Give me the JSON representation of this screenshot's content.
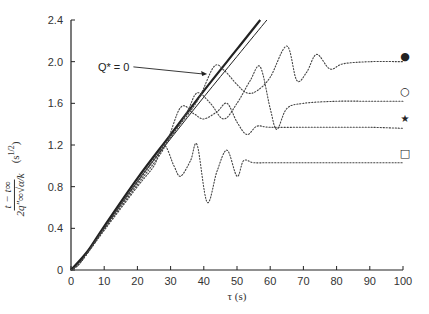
{
  "chart_data": {
    "type": "scatter",
    "title": "",
    "xlabel": "τ (s)",
    "ylabel": "(t − t∞) / (2q″∞ √α / k)",
    "ylabel_parts": {
      "numerator": "t − t∞",
      "denominator": "2q″∞√α/k",
      "units": "(s^1/2)"
    },
    "xlim": [
      0,
      100
    ],
    "ylim": [
      0,
      2.4
    ],
    "xticks": [
      0,
      10,
      20,
      30,
      40,
      50,
      60,
      70,
      80,
      90,
      100
    ],
    "yticks": [
      0,
      0.4,
      0.8,
      1.2,
      1.6,
      2.0,
      2.4
    ],
    "ytick_labels": [
      "0",
      "0.4",
      "0.8",
      "1.2",
      "1.6",
      "2.0",
      "2.4"
    ],
    "grid": false,
    "legend_position": "right-end markers",
    "annotations": [
      {
        "text": "Q* = 0",
        "x": 20,
        "y": 1.95,
        "arrow_to": [
          41,
          1.9
        ]
      }
    ],
    "series": [
      {
        "name": "Q* = 0 (theory, thick)",
        "style": "solid-thick",
        "x": [
          0,
          5,
          10,
          20,
          30,
          40,
          50,
          57
        ],
        "y": [
          0,
          0.18,
          0.42,
          0.88,
          1.3,
          1.72,
          2.12,
          2.4
        ]
      },
      {
        "name": "theory (thin)",
        "style": "solid-thin",
        "x": [
          0,
          5,
          10,
          20,
          30,
          40,
          50,
          59
        ],
        "y": [
          0,
          0.17,
          0.4,
          0.85,
          1.26,
          1.66,
          2.05,
          2.4
        ]
      },
      {
        "name": "filled circle",
        "marker": "●",
        "style": "dotted",
        "x": [
          0,
          3,
          10,
          20,
          30,
          38,
          43,
          46,
          50,
          53,
          56,
          60,
          65,
          68,
          71,
          74,
          78,
          82,
          90,
          100
        ],
        "y": [
          0,
          0.08,
          0.4,
          0.85,
          1.28,
          1.62,
          1.95,
          1.92,
          1.78,
          1.7,
          1.72,
          1.85,
          2.15,
          1.82,
          1.9,
          2.07,
          1.93,
          1.98,
          2.0,
          2.0
        ]
      },
      {
        "name": "open circle",
        "marker": "○",
        "style": "dotted",
        "x": [
          0,
          3,
          10,
          20,
          30,
          35,
          38,
          42,
          46,
          50,
          54,
          57,
          60,
          62,
          65,
          70,
          80,
          90,
          100
        ],
        "y": [
          0,
          0.08,
          0.4,
          0.84,
          1.27,
          1.52,
          1.7,
          1.6,
          1.45,
          1.6,
          1.82,
          1.95,
          1.55,
          1.35,
          1.55,
          1.6,
          1.62,
          1.62,
          1.62
        ]
      },
      {
        "name": "star",
        "marker": "★",
        "style": "dotted",
        "x": [
          0,
          3,
          10,
          20,
          28,
          33,
          37,
          40,
          44,
          47,
          50,
          53,
          56,
          60,
          70,
          80,
          90,
          100
        ],
        "y": [
          0,
          0.08,
          0.39,
          0.82,
          1.17,
          1.56,
          1.5,
          1.45,
          1.52,
          1.6,
          1.42,
          1.3,
          1.38,
          1.37,
          1.37,
          1.37,
          1.37,
          1.36
        ]
      },
      {
        "name": "open square",
        "marker": "□",
        "style": "dotted",
        "x": [
          0,
          3,
          10,
          20,
          25,
          28,
          31,
          33,
          36,
          38,
          41,
          44,
          47,
          50,
          52,
          55,
          60,
          70,
          80,
          90,
          100
        ],
        "y": [
          0,
          0.08,
          0.38,
          0.8,
          1.0,
          1.2,
          1.0,
          0.9,
          1.05,
          1.2,
          0.65,
          0.95,
          1.15,
          0.9,
          1.05,
          1.03,
          1.03,
          1.03,
          1.03,
          1.03,
          1.03
        ]
      }
    ]
  },
  "axes": {
    "x_title": "τ (s)",
    "y_units": "(s",
    "y_units_exp": "1/2",
    "y_num": "t − t∞",
    "y_den": "2q″∞√α/k"
  },
  "annotation": {
    "label": "Q* = 0"
  },
  "colors": {
    "ink": "#222222",
    "data": "#444444",
    "background": "#ffffff"
  }
}
